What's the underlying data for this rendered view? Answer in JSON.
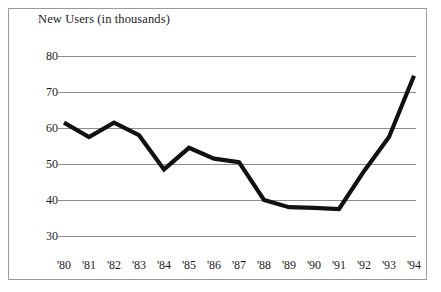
{
  "chart_data": {
    "type": "line",
    "title": "New Users (in thousands)",
    "xlabel": "",
    "ylabel": "",
    "categories": [
      "'80",
      "'81",
      "'82",
      "'83",
      "'84",
      "'85",
      "'86",
      "'87",
      "'88",
      "'89",
      "'90",
      "'91",
      "'92",
      "'93",
      "'94"
    ],
    "values": [
      61.5,
      57.5,
      61.5,
      58,
      48.5,
      54.5,
      51.5,
      50.5,
      40,
      38,
      37.8,
      37.5,
      48,
      57.5,
      74.5
    ],
    "series": [
      {
        "name": "New Users",
        "values": [
          61.5,
          57.5,
          61.5,
          58,
          48.5,
          54.5,
          51.5,
          50.5,
          40,
          38,
          37.8,
          37.5,
          48,
          57.5,
          74.5
        ]
      }
    ],
    "ylim": [
      28,
      83
    ],
    "yticks": [
      80,
      70,
      60,
      50,
      40,
      30
    ],
    "ytick_labels": [
      "80",
      "70",
      "60",
      "50",
      "40",
      "30"
    ],
    "xlim": [
      0,
      14
    ],
    "grid": "horizontal",
    "legend": "none",
    "line_color": "#111111",
    "grid_color": "#8c8c8c",
    "frame_color": "#9a9a9a",
    "background": "#ffffff"
  }
}
